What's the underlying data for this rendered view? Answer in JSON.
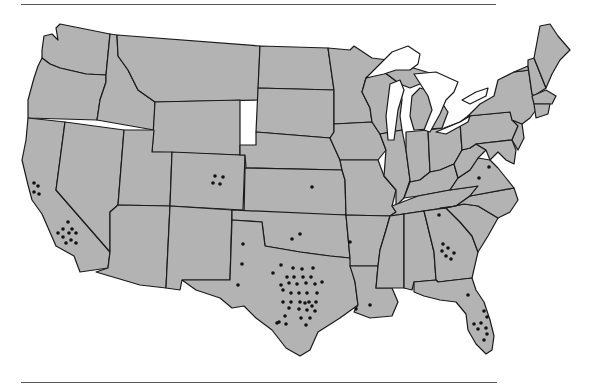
{
  "map": {
    "type": "us-state-outline-dot-map",
    "fill_color": "#b3b3b3",
    "border_color": "#1a1a1a",
    "water_color": "#ffffff",
    "dot_color": "#111111",
    "dot_radius": 1.8
  },
  "dot_groups": [
    {
      "state": "California",
      "count": 4,
      "points": [
        [
          34,
          183
        ],
        [
          38,
          186
        ],
        [
          34,
          192
        ],
        [
          39,
          194
        ]
      ]
    },
    {
      "state": "California",
      "count": 10,
      "points": [
        [
          68,
          222
        ],
        [
          63,
          229
        ],
        [
          72,
          229
        ],
        [
          58,
          233
        ],
        [
          69,
          233
        ],
        [
          76,
          233
        ],
        [
          63,
          237
        ],
        [
          71,
          240
        ],
        [
          66,
          243
        ],
        [
          76,
          243
        ]
      ]
    },
    {
      "state": "Colorado",
      "count": 4,
      "points": [
        [
          215,
          176
        ],
        [
          223,
          177
        ],
        [
          213,
          183
        ],
        [
          220,
          184
        ]
      ]
    },
    {
      "state": "Kansas",
      "count": 1,
      "points": [
        [
          312,
          187
        ]
      ]
    },
    {
      "state": "Oklahoma",
      "count": 2,
      "points": [
        [
          292,
          239
        ],
        [
          300,
          234
        ]
      ]
    },
    {
      "state": "New Mexico",
      "count": 3,
      "points": [
        [
          243,
          244
        ],
        [
          242,
          264
        ],
        [
          238,
          285
        ]
      ]
    },
    {
      "state": "Arkansas",
      "count": 1,
      "points": [
        [
          350,
          242
        ]
      ]
    },
    {
      "state": "Tennessee",
      "count": 1,
      "points": [
        [
          439,
          215
        ]
      ]
    },
    {
      "state": "Virginia",
      "count": 2,
      "points": [
        [
          489,
          167
        ],
        [
          479,
          178
        ]
      ]
    },
    {
      "state": "Georgia",
      "count": 6,
      "points": [
        [
          442,
          251
        ],
        [
          448,
          248
        ],
        [
          454,
          253
        ],
        [
          446,
          256
        ],
        [
          451,
          259
        ],
        [
          443,
          244
        ]
      ]
    },
    {
      "state": "Louisiana",
      "count": 2,
      "points": [
        [
          356,
          309
        ],
        [
          370,
          305
        ]
      ]
    },
    {
      "state": "Florida",
      "count": 9,
      "points": [
        [
          468,
          295
        ],
        [
          484,
          311
        ],
        [
          487,
          317
        ],
        [
          474,
          324
        ],
        [
          481,
          323
        ],
        [
          478,
          329
        ],
        [
          486,
          328
        ],
        [
          487,
          334
        ],
        [
          484,
          340
        ]
      ]
    },
    {
      "state": "Texas",
      "count": 36,
      "points": [
        [
          281,
          265
        ],
        [
          293,
          268
        ],
        [
          302,
          269
        ],
        [
          313,
          268
        ],
        [
          287,
          277
        ],
        [
          294,
          277
        ],
        [
          303,
          277
        ],
        [
          311,
          277
        ],
        [
          273,
          273
        ],
        [
          281,
          285
        ],
        [
          289,
          283
        ],
        [
          297,
          284
        ],
        [
          306,
          283
        ],
        [
          315,
          284
        ],
        [
          283,
          290
        ],
        [
          291,
          293
        ],
        [
          299,
          293
        ],
        [
          307,
          293
        ],
        [
          317,
          293
        ],
        [
          283,
          302
        ],
        [
          291,
          302
        ],
        [
          300,
          302
        ],
        [
          309,
          302
        ],
        [
          316,
          302
        ],
        [
          289,
          308
        ],
        [
          285,
          316
        ],
        [
          279,
          322
        ],
        [
          322,
          282
        ],
        [
          305,
          303
        ],
        [
          312,
          306
        ],
        [
          299,
          309
        ],
        [
          307,
          310
        ],
        [
          315,
          311
        ],
        [
          301,
          318
        ],
        [
          310,
          318
        ],
        [
          306,
          325
        ]
      ]
    },
    {
      "state": "Texas",
      "count": 2,
      "points": [
        [
          277,
          323
        ],
        [
          286,
          324
        ]
      ]
    }
  ]
}
